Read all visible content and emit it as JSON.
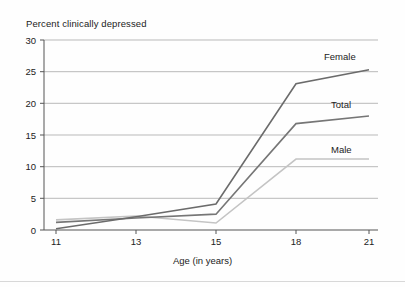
{
  "chart_data": {
    "type": "line",
    "title": "Percent clinically depressed",
    "xlabel": "Age (in years)",
    "ylabel": "",
    "categories": [
      "11",
      "13",
      "15",
      "18",
      "21"
    ],
    "x": [
      11,
      13,
      15,
      18,
      21
    ],
    "xtick_labels": [
      "11",
      "13",
      "15",
      "18",
      "21"
    ],
    "ytick_labels": [
      "0",
      "5",
      "10",
      "15",
      "20",
      "25",
      "30"
    ],
    "yticks": [
      0,
      5,
      10,
      15,
      20,
      25,
      30
    ],
    "ylim": [
      0,
      30
    ],
    "grid": true,
    "legend_position": "right-inline-labels",
    "series": [
      {
        "name": "Female",
        "color": "#6b6b6b",
        "values": [
          0.2,
          2.1,
          4.1,
          23.1,
          25.3
        ]
      },
      {
        "name": "Total",
        "color": "#767676",
        "values": [
          1.2,
          1.9,
          2.5,
          16.8,
          18.0
        ]
      },
      {
        "name": "Male",
        "color": "#c4c4c4",
        "values": [
          1.6,
          2.2,
          1.1,
          11.2,
          11.2
        ]
      }
    ]
  },
  "labels": {
    "female": "Female",
    "total": "Total",
    "male": "Male"
  },
  "colors": {
    "female_line": "#6b6b6b",
    "total_line": "#767676",
    "male_line": "#c4c4c4",
    "grid": "#b9b9b9",
    "axis": "#555555",
    "text": "#222222"
  }
}
